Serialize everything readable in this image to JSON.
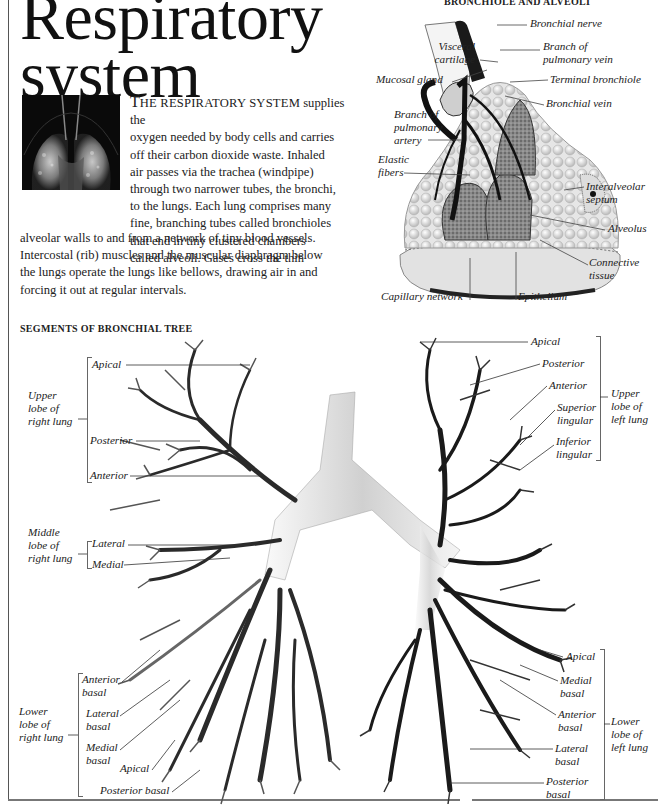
{
  "page": {
    "title_line1": "Respiratory",
    "title_line2": "system"
  },
  "intro": {
    "drop_cap": "T",
    "small_caps": "HE RESPIRATORY SYSTEM",
    "lines_wrapped": [
      " supplies the",
      "oxygen needed by body cells and carries",
      "off their carbon dioxide waste. Inhaled",
      "air passes via the trachea (windpipe)",
      "through two narrower tubes, the bronchi,",
      "to the lungs. Each lung comprises many",
      "fine, branching tubes called bronchioles",
      "that end in tiny clustered chambers",
      "called alveoli. Gases cross the thin"
    ],
    "lines_full": [
      "alveolar walls to and from a network of tiny blood vessels.",
      "Intercostal (rib) muscles and the muscular diaphragm below",
      "the lungs operate the lungs like bellows, drawing air in and",
      "forcing it out at regular intervals."
    ],
    "thumbnail_icon": "lung-xray-image"
  },
  "bronchiole_section": {
    "heading": "BRONCHIOLE AND ALVEOLI",
    "illustration_icon": "bronchiole-alveoli-illustration",
    "labels": {
      "bronchial_nerve": "Bronchial nerve",
      "visceral_cartilage_1": "Visceral",
      "visceral_cartilage_2": "cartilage",
      "branch_pulm_vein_1": "Branch of",
      "branch_pulm_vein_2": "pulmonary vein",
      "mucosal_gland": "Mucosal gland",
      "terminal_bronchiole": "Terminal bronchiole",
      "bronchial_vein": "Bronchial vein",
      "branch_pulm_artery_1": "Branch of",
      "branch_pulm_artery_2": "pulmonary",
      "branch_pulm_artery_3": "artery",
      "elastic_fibers_1": "Elastic",
      "elastic_fibers_2": "fibers",
      "interalveolar_1": "Interalveolar",
      "interalveolar_2": "septum",
      "alveolus": "Alveolus",
      "connective_1": "Connective",
      "connective_2": "tissue",
      "capillary_network": "Capillary network",
      "epithelium": "Epithelium"
    }
  },
  "bronchial_tree": {
    "heading": "SEGMENTS OF BRONCHIAL TREE",
    "illustration_icon": "bronchial-tree-illustration",
    "right_lung": {
      "upper_lobe": [
        "Upper",
        "lobe of",
        "right lung"
      ],
      "upper_segments": [
        "Apical",
        "Posterior",
        "Anterior"
      ],
      "middle_lobe": [
        "Middle",
        "lobe of",
        "right lung"
      ],
      "middle_segments": [
        "Lateral",
        "Medial"
      ],
      "lower_lobe": [
        "Lower",
        "lobe of",
        "right lung"
      ],
      "lower_segments": {
        "anterior_basal": [
          "Anterior",
          "basal"
        ],
        "lateral_basal": [
          "Lateral",
          "basal"
        ],
        "medial_basal": [
          "Medial",
          "basal"
        ],
        "apical": "Apical",
        "posterior_basal": "Posterior basal"
      }
    },
    "left_lung": {
      "upper_lobe": [
        "Upper",
        "lobe of",
        "left lung"
      ],
      "upper_segments": {
        "apical": "Apical",
        "posterior": "Posterior",
        "anterior": "Anterior",
        "superior_lingular": [
          "Superior",
          "lingular"
        ],
        "inferior_lingular": [
          "Inferior",
          "lingular"
        ]
      },
      "lower_lobe": [
        "Lower",
        "lobe of",
        "left lung"
      ],
      "lower_segments": {
        "apical": "Apical",
        "medial_basal": [
          "Medial",
          "basal"
        ],
        "anterior_basal": [
          "Anterior",
          "basal"
        ],
        "lateral_basal": [
          "Lateral",
          "basal"
        ],
        "posterior_basal": [
          "Posterior",
          "basal"
        ]
      }
    }
  },
  "colors": {
    "text": "#1a1a1a",
    "rule": "#666666",
    "background": "#ffffff"
  }
}
